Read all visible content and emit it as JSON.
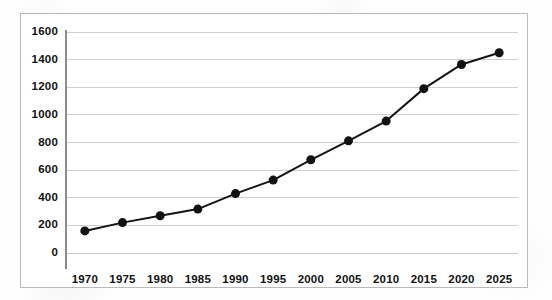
{
  "chart_data": {
    "type": "line",
    "title": "",
    "subtitle": "",
    "xlabel": "",
    "ylabel": "",
    "categories": [
      "1970",
      "1975",
      "1980",
      "1985",
      "1990",
      "1995",
      "2000",
      "2005",
      "2010",
      "2015",
      "2020",
      "2025"
    ],
    "x": [
      1970,
      1975,
      1980,
      1985,
      1990,
      1995,
      2000,
      2005,
      2010,
      2015,
      2020,
      2025
    ],
    "values": [
      160,
      220,
      270,
      318,
      430,
      528,
      675,
      812,
      955,
      1190,
      1365,
      1450
    ],
    "series": [
      {
        "name": "",
        "values": [
          160,
          220,
          270,
          318,
          430,
          528,
          675,
          812,
          955,
          1190,
          1365,
          1450
        ]
      }
    ],
    "ylim": [
      0,
      1600
    ],
    "yticks": [
      0,
      200,
      400,
      600,
      800,
      1000,
      1200,
      1400,
      1600
    ],
    "ytick_labels": [
      "0",
      "200",
      "400",
      "600",
      "800",
      "1000",
      "1200",
      "1400",
      "1600"
    ],
    "xtick_labels": [
      "1970",
      "1975",
      "1980",
      "1985",
      "1990",
      "1995",
      "2000",
      "2005",
      "2010",
      "2015",
      "2020",
      "2025"
    ],
    "grid": "horizontal",
    "legend": "none",
    "annotations": [],
    "colors": {
      "line": "#141414",
      "marker": "#121212",
      "gridline": "#cfcfcf",
      "axis": "#8a8a8a",
      "frame": "#b9b9b9",
      "background": "#ffffff",
      "text": "#111111"
    },
    "style": {
      "line_width": 2,
      "marker_shape": "circle",
      "marker_size": 9
    }
  }
}
